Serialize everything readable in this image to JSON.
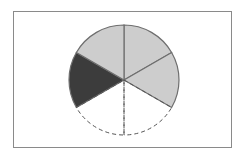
{
  "diagram": {
    "title": "",
    "shape": "circle divided into 6 equal sectors",
    "total_parts": 6,
    "center": [
      124,
      80
    ],
    "radius": 55,
    "sectors": [
      {
        "index": 0,
        "start_deg": -90,
        "end_deg": -30,
        "state": "shaded-light",
        "fill": "#cdcdcd"
      },
      {
        "index": 1,
        "start_deg": -30,
        "end_deg": 30,
        "state": "shaded-light",
        "fill": "#cdcdcd"
      },
      {
        "index": 2,
        "start_deg": 30,
        "end_deg": 90,
        "state": "missing-dashed",
        "fill": "none"
      },
      {
        "index": 3,
        "start_deg": 90,
        "end_deg": 150,
        "state": "missing-dashed",
        "fill": "none"
      },
      {
        "index": 4,
        "start_deg": 150,
        "end_deg": 210,
        "state": "shaded-dark",
        "fill": "#3c3c3c"
      },
      {
        "index": 5,
        "start_deg": 210,
        "end_deg": 270,
        "state": "shaded-light",
        "fill": "#cdcdcd"
      }
    ],
    "counts": {
      "light": 3,
      "dark": 1,
      "missing": 2
    },
    "colors": {
      "light": "#cdcdcd",
      "dark": "#3c3c3c",
      "outline": "#6e6e6e",
      "dashed": "#555555",
      "frame": "#8a8a8a"
    }
  }
}
